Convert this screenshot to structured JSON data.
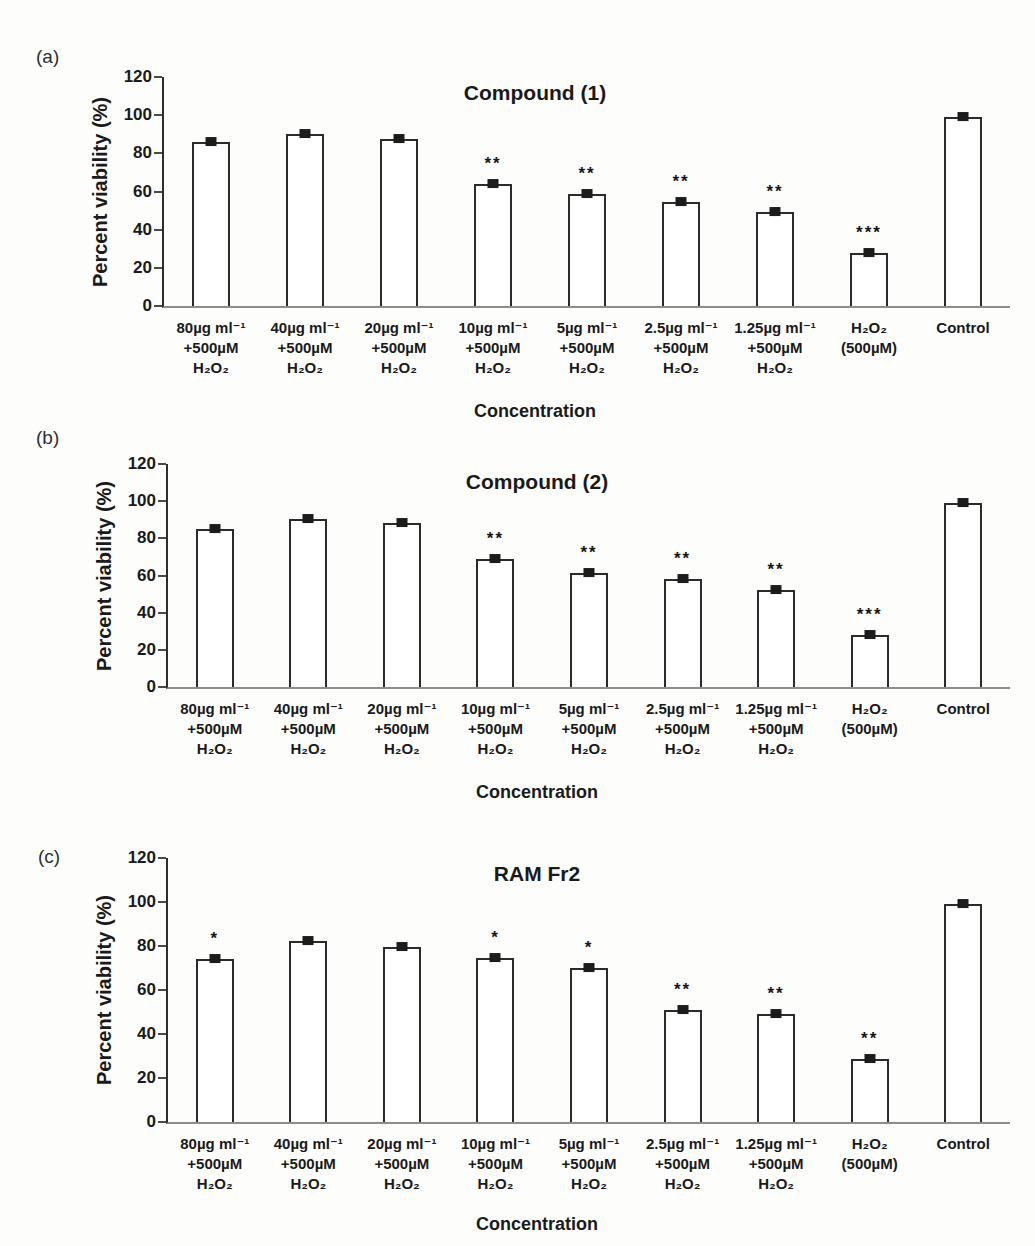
{
  "figure": {
    "panels": [
      "(a)",
      "(b)",
      "(c)"
    ]
  },
  "chart_data": [
    {
      "type": "bar",
      "panel_label": "(a)",
      "title": "Compound (1)",
      "xlabel": "Concentration",
      "ylabel": "Percent viability (%)",
      "ylim": [
        0,
        120
      ],
      "yticks": [
        0,
        20,
        40,
        60,
        80,
        100,
        120
      ],
      "grid": false,
      "legend": "none",
      "bar_fill": "#ffffff",
      "bar_border": "#2b2b2b",
      "error_bars": "small square markers at bar tops (~±1%)",
      "categories": [
        [
          "80µg ml⁻¹",
          "+500µM",
          "H₂O₂"
        ],
        [
          "40µg ml⁻¹",
          "+500µM",
          "H₂O₂"
        ],
        [
          "20µg ml⁻¹",
          "+500µM",
          "H₂O₂"
        ],
        [
          "10µg ml⁻¹",
          "+500µM",
          "H₂O₂"
        ],
        [
          "5µg ml⁻¹",
          "+500µM",
          "H₂O₂"
        ],
        [
          "2.5µg ml⁻¹",
          "+500µM",
          "H₂O₂"
        ],
        [
          "1.25µg ml⁻¹",
          "+500µM",
          "H₂O₂"
        ],
        [
          "H₂O₂",
          "(500µM)"
        ],
        [
          "Control"
        ]
      ],
      "values": [
        86,
        90,
        87.5,
        64,
        58.5,
        54.5,
        49,
        28,
        99
      ],
      "significance": [
        "",
        "",
        "",
        "**",
        "**",
        "**",
        "**",
        "***",
        ""
      ]
    },
    {
      "type": "bar",
      "panel_label": "(b)",
      "title": "Compound (2)",
      "xlabel": "Concentration",
      "ylabel": "Percent viability (%)",
      "ylim": [
        0,
        120
      ],
      "yticks": [
        0,
        20,
        40,
        60,
        80,
        100,
        120
      ],
      "grid": false,
      "legend": "none",
      "bar_fill": "#ffffff",
      "bar_border": "#2b2b2b",
      "error_bars": "small square markers at bar tops (~±1%)",
      "categories": [
        [
          "80µg ml⁻¹",
          "+500µM",
          "H₂O₂"
        ],
        [
          "40µg ml⁻¹",
          "+500µM",
          "H₂O₂"
        ],
        [
          "20µg ml⁻¹",
          "+500µM",
          "H₂O₂"
        ],
        [
          "10µg ml⁻¹",
          "+500µM",
          "H₂O₂"
        ],
        [
          "5µg ml⁻¹",
          "+500µM",
          "H₂O₂"
        ],
        [
          "2.5µg ml⁻¹",
          "+500µM",
          "H₂O₂"
        ],
        [
          "1.25µg ml⁻¹",
          "+500µM",
          "H₂O₂"
        ],
        [
          "H₂O₂",
          "(500µM)"
        ],
        [
          "Control"
        ]
      ],
      "values": [
        85,
        90.5,
        88,
        69,
        61.5,
        58,
        52,
        28,
        99
      ],
      "significance": [
        "",
        "",
        "",
        "**",
        "**",
        "**",
        "**",
        "***",
        ""
      ]
    },
    {
      "type": "bar",
      "panel_label": "(c)",
      "title": "RAM Fr2",
      "xlabel": "Concentration",
      "ylabel": "Percent viability (%)",
      "ylim": [
        0,
        120
      ],
      "yticks": [
        0,
        20,
        40,
        60,
        80,
        100,
        120
      ],
      "grid": false,
      "legend": "none",
      "bar_fill": "#ffffff",
      "bar_border": "#2b2b2b",
      "error_bars": "small square markers at bar tops (~±1%)",
      "categories": [
        [
          "80µg ml⁻¹",
          "+500µM",
          "H₂O₂"
        ],
        [
          "40µg ml⁻¹",
          "+500µM",
          "H₂O₂"
        ],
        [
          "20µg ml⁻¹",
          "+500µM",
          "H₂O₂"
        ],
        [
          "10µg ml⁻¹",
          "+500µM",
          "H₂O₂"
        ],
        [
          "5µg ml⁻¹",
          "+500µM",
          "H₂O₂"
        ],
        [
          "2.5µg ml⁻¹",
          "+500µM",
          "H₂O₂"
        ],
        [
          "1.25µg ml⁻¹",
          "+500µM",
          "H₂O₂"
        ],
        [
          "H₂O₂",
          "(500µM)"
        ],
        [
          "Control"
        ]
      ],
      "values": [
        74,
        82.5,
        79.5,
        74.5,
        70,
        51,
        49,
        28.5,
        99
      ],
      "significance": [
        "*",
        "",
        "",
        "*",
        "*",
        "**",
        "**",
        "**",
        ""
      ]
    }
  ]
}
